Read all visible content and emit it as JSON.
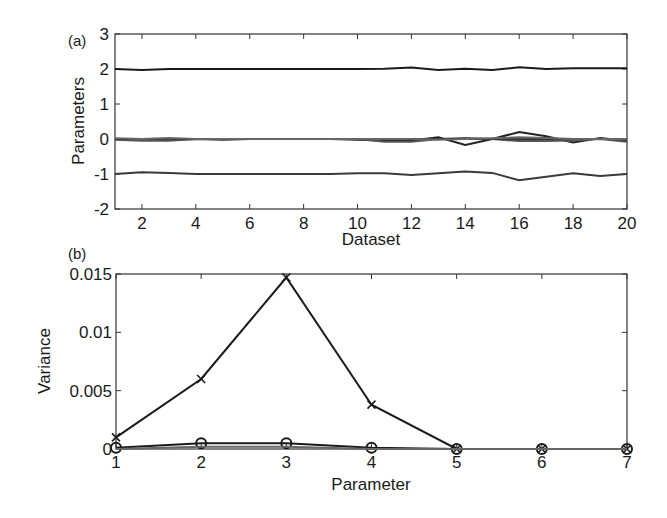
{
  "chart_data": [
    {
      "panel": "(a)",
      "type": "line",
      "title": "",
      "xlabel": "Dataset",
      "ylabel": "Parameters",
      "xlim": [
        1,
        20
      ],
      "ylim": [
        -2,
        3
      ],
      "xticks": [
        2,
        4,
        6,
        8,
        10,
        12,
        14,
        16,
        18,
        20
      ],
      "yticks": [
        -2,
        -1,
        0,
        1,
        2,
        3
      ],
      "grid": false,
      "x": [
        1,
        2,
        3,
        4,
        5,
        6,
        7,
        8,
        9,
        10,
        11,
        12,
        13,
        14,
        15,
        16,
        17,
        18,
        19,
        20
      ],
      "series": [
        {
          "name": "p1",
          "values": [
            2.0,
            1.97,
            2.0,
            2.0,
            2.0,
            2.0,
            2.0,
            2.0,
            2.0,
            2.0,
            2.01,
            2.04,
            1.97,
            2.01,
            1.97,
            2.05,
            2.0,
            2.02,
            2.02,
            2.02
          ]
        },
        {
          "name": "p2",
          "values": [
            0.0,
            -0.03,
            -0.02,
            0.0,
            -0.02,
            0.0,
            0.0,
            0.0,
            0.0,
            -0.02,
            -0.04,
            -0.04,
            0.05,
            -0.17,
            0.0,
            0.2,
            0.08,
            -0.1,
            0.03,
            -0.05
          ]
        },
        {
          "name": "p3",
          "values": [
            0.0,
            0.0,
            0.0,
            0.0,
            0.0,
            0.0,
            0.0,
            0.0,
            0.0,
            0.0,
            0.0,
            0.0,
            0.0,
            0.0,
            0.0,
            0.0,
            0.0,
            0.0,
            0.0,
            0.0
          ]
        },
        {
          "name": "p4",
          "values": [
            -0.02,
            -0.05,
            -0.05,
            0.0,
            0.0,
            0.0,
            0.0,
            0.0,
            0.0,
            0.0,
            -0.08,
            -0.08,
            0.0,
            0.03,
            0.0,
            -0.06,
            -0.06,
            -0.04,
            0.0,
            -0.08
          ]
        },
        {
          "name": "p5",
          "values": [
            0.0,
            0.0,
            0.0,
            0.0,
            0.0,
            0.0,
            0.0,
            0.0,
            0.0,
            0.0,
            0.0,
            0.0,
            0.0,
            0.0,
            0.0,
            0.0,
            0.0,
            0.0,
            0.0,
            0.0
          ]
        },
        {
          "name": "p6",
          "values": [
            0.02,
            0.0,
            0.03,
            0.0,
            0.0,
            0.0,
            0.0,
            0.0,
            0.0,
            0.0,
            0.0,
            0.0,
            -0.02,
            0.0,
            0.02,
            0.05,
            0.03,
            0.0,
            0.0,
            0.0
          ]
        },
        {
          "name": "p7",
          "values": [
            -1.0,
            -0.95,
            -0.97,
            -1.0,
            -1.0,
            -1.0,
            -1.0,
            -1.0,
            -1.0,
            -0.98,
            -0.98,
            -1.03,
            -0.98,
            -0.93,
            -0.97,
            -1.18,
            -1.08,
            -0.98,
            -1.06,
            -1.0
          ]
        }
      ]
    },
    {
      "panel": "(b)",
      "type": "line",
      "title": "",
      "xlabel": "Parameter",
      "ylabel": "Variance",
      "xlim": [
        1,
        7
      ],
      "ylim": [
        0,
        0.015
      ],
      "xticks": [
        1,
        2,
        3,
        4,
        5,
        6,
        7
      ],
      "yticks": [
        0,
        0.005,
        0.01,
        0.015
      ],
      "ytick_labels": [
        "0",
        "0.005",
        "0.01",
        "0.015"
      ],
      "grid": false,
      "categories": [
        1,
        2,
        3,
        4,
        5,
        6,
        7
      ],
      "series": [
        {
          "name": "x-marker series",
          "marker": "x",
          "values": [
            0.001,
            0.006,
            0.0147,
            0.0038,
            0.0,
            0.0,
            0.0
          ]
        },
        {
          "name": "circle-marker series",
          "marker": "o",
          "values": [
            0.0001,
            0.0005,
            0.0005,
            0.0001,
            0.0,
            0.0,
            0.0
          ]
        },
        {
          "name": "plain series",
          "marker": "none",
          "values": [
            0.0,
            0.0002,
            0.0002,
            0.0,
            0.0,
            0.0,
            0.0
          ]
        }
      ]
    }
  ]
}
